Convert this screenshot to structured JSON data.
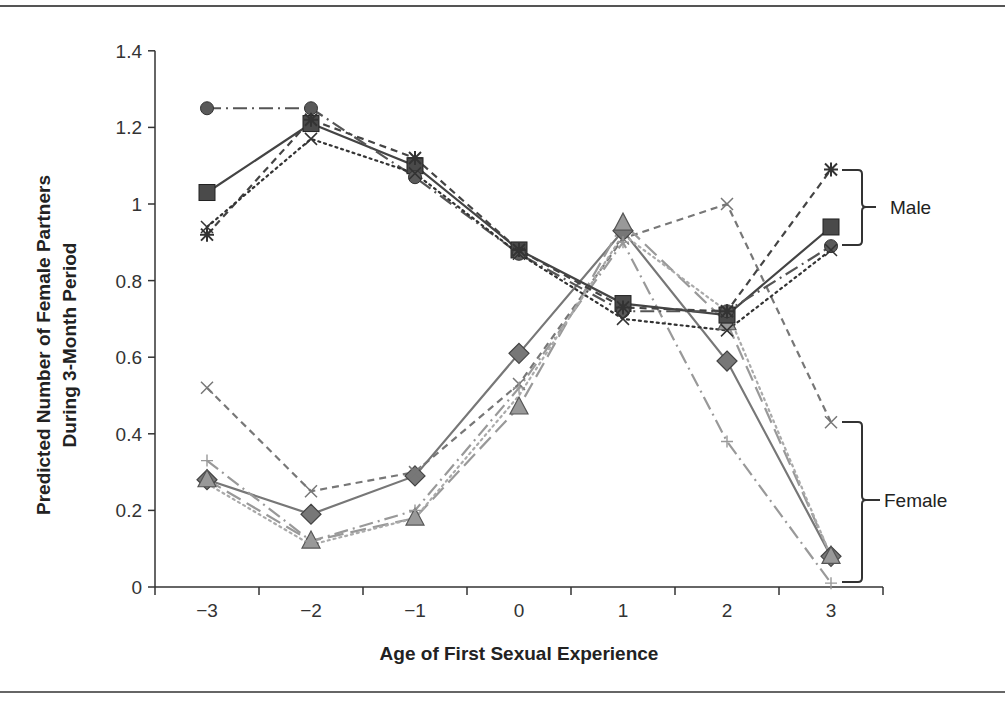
{
  "chart_data": {
    "type": "line",
    "title": "",
    "xlabel": "Age of First Sexual Experience",
    "ylabel_line1": "Predicted Number of Female Partners",
    "ylabel_line2": "During 3-Month Period",
    "ylabel": "Predicted Number of Female Partners During 3-Month Period",
    "x": [
      -3,
      -2,
      -1,
      0,
      1,
      2,
      3
    ],
    "x_tick_labels": [
      "−3",
      "−2",
      "−1",
      "0",
      "1",
      "2",
      "3"
    ],
    "y_ticks": [
      0,
      0.2,
      0.4,
      0.6,
      0.8,
      1,
      1.2,
      1.4
    ],
    "y_tick_labels": [
      "0",
      "0.2",
      "0.4",
      "0.6",
      "0.8",
      "1",
      "1.2",
      "1.4"
    ],
    "ylim": [
      0,
      1.4
    ],
    "xlim": [
      -3.5,
      3.5
    ],
    "grid": false,
    "legend": "none",
    "annotations": [
      {
        "text": "Male",
        "type": "bracket",
        "range": [
          0.88,
          1.09
        ]
      },
      {
        "text": "Female",
        "type": "bracket",
        "range": [
          0.01,
          0.43
        ]
      }
    ],
    "series": [
      {
        "name": "Male 1",
        "group": "Male",
        "marker": "square",
        "line": "solid",
        "color": "#444444",
        "values": [
          1.03,
          1.21,
          1.1,
          0.88,
          0.74,
          0.71,
          0.94
        ]
      },
      {
        "name": "Male 2",
        "group": "Male",
        "marker": "circle",
        "line": "dashdot",
        "color": "#555555",
        "values": [
          1.25,
          1.25,
          1.07,
          0.87,
          0.72,
          0.72,
          0.89
        ]
      },
      {
        "name": "Male 3",
        "group": "Male",
        "marker": "asterisk",
        "line": "dash",
        "color": "#444444",
        "values": [
          0.92,
          1.22,
          1.12,
          0.88,
          0.73,
          0.72,
          1.09
        ]
      },
      {
        "name": "Male 4",
        "group": "Male",
        "marker": "x",
        "line": "dotted",
        "color": "#333333",
        "values": [
          0.94,
          1.17,
          1.08,
          0.87,
          0.7,
          0.67,
          0.88
        ]
      },
      {
        "name": "Female 1",
        "group": "Female",
        "marker": "diamond",
        "line": "solid",
        "color": "#777777",
        "values": [
          0.28,
          0.19,
          0.29,
          0.61,
          0.93,
          0.59,
          0.08
        ]
      },
      {
        "name": "Female 2",
        "group": "Female",
        "marker": "x",
        "line": "dash",
        "color": "#777777",
        "values": [
          0.52,
          0.25,
          0.3,
          0.53,
          0.91,
          1.0,
          0.43
        ]
      },
      {
        "name": "Female 3",
        "group": "Female",
        "marker": "triangle",
        "line": "longdash",
        "color": "#999999",
        "values": [
          0.28,
          0.12,
          0.18,
          0.47,
          0.95,
          0.69,
          0.08
        ]
      },
      {
        "name": "Female 4",
        "group": "Female",
        "marker": "plus",
        "line": "dashdot",
        "color": "#999999",
        "values": [
          0.33,
          0.12,
          0.2,
          0.52,
          0.9,
          0.38,
          0.01
        ]
      },
      {
        "name": "Female 5",
        "group": "Female",
        "marker": "none",
        "line": "dotted",
        "color": "#aaaaaa",
        "values": [
          0.27,
          0.11,
          0.18,
          0.5,
          0.92,
          0.72,
          0.08
        ]
      }
    ]
  },
  "labels": {
    "male": "Male",
    "female": "Female"
  }
}
